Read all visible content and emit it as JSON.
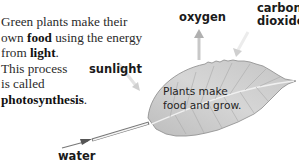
{
  "intro": {
    "line1": "Green plants make their",
    "line2_pre": "own ",
    "line2_bold": "food",
    "line2_post": " using the energy",
    "line3_pre": "from ",
    "line3_bold": "light",
    "line3_post": ".",
    "line4": "This process",
    "line5": "is called",
    "line6_bold": "photosynthesis",
    "line6_post": "."
  },
  "labels": {
    "sunlight": "sunlight",
    "oxygen": "oxygen",
    "carbon_dioxide_line1": "carbon",
    "carbon_dioxide_line2": "dioxide",
    "water": "water"
  },
  "leaf": {
    "caption_line1": "Plants make",
    "caption_line2": "food and grow."
  },
  "colors": {
    "leaf_fill": "#cfcfcf",
    "leaf_edge": "#8a8a8a",
    "arrow": "#b5b5b5",
    "water_arrow": "#555555"
  }
}
